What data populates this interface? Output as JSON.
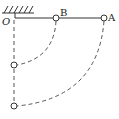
{
  "diagram": {
    "type": "physics-pendulum-rod",
    "labels": {
      "pivot": "O",
      "ball_b": "B",
      "ball_a": "A"
    },
    "colors": {
      "line": "#333333",
      "dashed": "#555555",
      "background": "#ffffff"
    },
    "elements": [
      {
        "name": "ceiling",
        "description": "hatched fixed support"
      },
      {
        "name": "rod",
        "description": "light rod from O horizontally, ball B at middle, ball A at end"
      },
      {
        "name": "vertical-dashed-line",
        "description": "dashed vertical line below O"
      },
      {
        "name": "arc-b",
        "description": "dashed arc traced by B to lowest point"
      },
      {
        "name": "arc-a",
        "description": "dashed arc traced by A to lowest point"
      },
      {
        "name": "ball-b-lowest",
        "description": "B at lowest position"
      },
      {
        "name": "ball-a-lowest",
        "description": "A at lowest position"
      }
    ]
  }
}
